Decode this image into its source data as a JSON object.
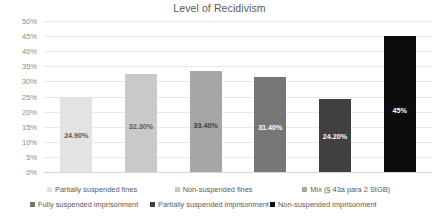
{
  "chart_data": {
    "type": "bar",
    "title": "Level of Recidivism",
    "xlabel": "",
    "ylabel": "",
    "ylim": [
      0,
      50
    ],
    "grid": true,
    "legend_position": "bottom",
    "y_ticks": [
      "50%",
      "45%",
      "40%",
      "35%",
      "30%",
      "25%",
      "20%",
      "15%",
      "10%",
      "5%",
      "0%"
    ],
    "categories": [
      "Partially suspended fines",
      "Non-suspended fines",
      "Mix (§ 43a para 2 StGB)",
      "Fully suspended imprisonment",
      "Partially suspended imprisonment",
      "Non-suspended imprisonment"
    ],
    "values": [
      24.9,
      32.3,
      33.4,
      31.4,
      24.2,
      45.0
    ],
    "data_labels": [
      "24.90%",
      "32.30%",
      "33.40%",
      "31.40%",
      "24.20%",
      "45%"
    ],
    "colors": [
      "#e3e3e3",
      "#c9c9c9",
      "#a6a6a6",
      "#767676",
      "#404040",
      "#0d0d0d"
    ],
    "label_colors": [
      "#595959",
      "#595959",
      "#3f3f3f",
      "#ffffff",
      "#ffffff",
      "#ffffff"
    ]
  },
  "legend": {
    "items": [
      {
        "label": "Partially suspended fines",
        "color": "#e3e3e3"
      },
      {
        "label": "Non-suspended fines",
        "color": "#c9c9c9"
      },
      {
        "label": "Mix (§ 43a para 2 StGB)",
        "color": "#a6a6a6"
      },
      {
        "label": "Fully suspended imprisonment",
        "color": "#767676"
      },
      {
        "label": "Partially suspended imprisonment",
        "color": "#404040"
      },
      {
        "label": "Non-suspended imprisonment",
        "color": "#0d0d0d"
      }
    ]
  }
}
